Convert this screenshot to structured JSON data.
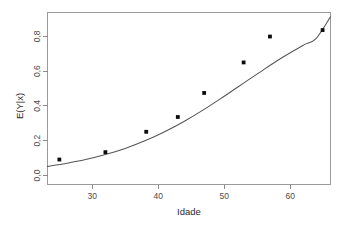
{
  "chart_data": {
    "type": "scatter",
    "title": "",
    "subtitle": "",
    "xlabel": "Idade",
    "ylabel": "E(Y|x)",
    "xlim": [
      23.2,
      66.2
    ],
    "ylim": [
      -0.035,
      0.895
    ],
    "grid": false,
    "legend": null,
    "xticks": [
      30,
      40,
      50,
      60
    ],
    "xtick_labels": [
      "30",
      "40",
      "50",
      "60"
    ],
    "yticks": [
      0.0,
      0.2,
      0.4,
      0.6,
      0.8
    ],
    "ytick_labels": [
      "0,0",
      "0,2",
      "0,4",
      "0,6",
      "0,8"
    ],
    "series": [
      {
        "name": "observed-proportions",
        "type": "scatter",
        "marker": "filled-square",
        "color": "#0d0d0d",
        "points": [
          {
            "x": 25.0,
            "y": 0.1
          },
          {
            "x": 32.0,
            "y": 0.14
          },
          {
            "x": 38.2,
            "y": 0.25
          },
          {
            "x": 43.0,
            "y": 0.33
          },
          {
            "x": 47.0,
            "y": 0.46
          },
          {
            "x": 53.0,
            "y": 0.625
          },
          {
            "x": 57.0,
            "y": 0.765
          },
          {
            "x": 65.0,
            "y": 0.8
          }
        ]
      },
      {
        "name": "fitted-logistic-curve",
        "type": "line",
        "color": "#555555",
        "model": "logistic",
        "points": [
          {
            "x": 23.2,
            "y": 0.063
          },
          {
            "x": 26.0,
            "y": 0.079
          },
          {
            "x": 29.0,
            "y": 0.1
          },
          {
            "x": 32.0,
            "y": 0.127
          },
          {
            "x": 35.0,
            "y": 0.16
          },
          {
            "x": 38.0,
            "y": 0.201
          },
          {
            "x": 41.0,
            "y": 0.25
          },
          {
            "x": 44.0,
            "y": 0.307
          },
          {
            "x": 47.0,
            "y": 0.371
          },
          {
            "x": 50.0,
            "y": 0.441
          },
          {
            "x": 53.0,
            "y": 0.513
          },
          {
            "x": 56.0,
            "y": 0.585
          },
          {
            "x": 59.0,
            "y": 0.654
          },
          {
            "x": 62.0,
            "y": 0.717
          },
          {
            "x": 64.0,
            "y": 0.754
          },
          {
            "x": 66.2,
            "y": 0.872
          }
        ]
      }
    ]
  },
  "axes": {
    "x_title": "Idade",
    "y_title": "E(Y|x)"
  },
  "ticks": {
    "x": [
      "30",
      "40",
      "50",
      "60"
    ],
    "y": [
      "0,0",
      "0,2",
      "0,4",
      "0,6",
      "0,8"
    ]
  },
  "colors": {
    "point": "#0d0d0d",
    "curve": "#555555",
    "frame": "#9a9a9a",
    "background": "#ffffff"
  }
}
